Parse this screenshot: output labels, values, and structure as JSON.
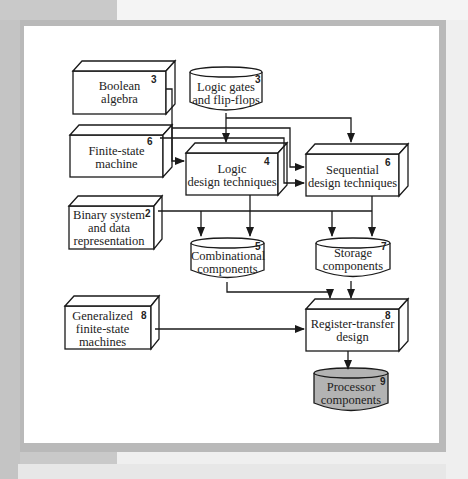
{
  "diagram": {
    "type": "flowchart",
    "nodes": [
      {
        "id": "boolean",
        "shape": "box3d",
        "label_line1": "Boolean",
        "label_line2": "algebra",
        "label_line3": "",
        "chapter": "3"
      },
      {
        "id": "gates",
        "shape": "cylinder",
        "label_line1": "Logic gates",
        "label_line2": "and flip-flops",
        "label_line3": "",
        "chapter": "3"
      },
      {
        "id": "fsm",
        "shape": "box3d",
        "label_line1": "Finite-state",
        "label_line2": "machine",
        "label_line3": "",
        "chapter": "6"
      },
      {
        "id": "logic",
        "shape": "box3d",
        "label_line1": "Logic",
        "label_line2": "design techniques",
        "label_line3": "",
        "chapter": "4"
      },
      {
        "id": "seq",
        "shape": "box3d",
        "label_line1": "Sequential",
        "label_line2": "design techniques",
        "label_line3": "",
        "chapter": "6"
      },
      {
        "id": "binary",
        "shape": "box3d",
        "label_line1": "Binary system",
        "label_line2": "and data",
        "label_line3": "representation",
        "chapter": "2"
      },
      {
        "id": "comb",
        "shape": "cylinder",
        "label_line1": "Combinational",
        "label_line2": "components",
        "label_line3": "",
        "chapter": "5"
      },
      {
        "id": "storage",
        "shape": "cylinder",
        "label_line1": "Storage",
        "label_line2": "components",
        "label_line3": "",
        "chapter": "7"
      },
      {
        "id": "gfsm",
        "shape": "box3d",
        "label_line1": "Generalized",
        "label_line2": "finite-state",
        "label_line3": "machines",
        "chapter": "8"
      },
      {
        "id": "rtl",
        "shape": "box3d",
        "label_line1": "Register-transfer",
        "label_line2": "design",
        "label_line3": "",
        "chapter": "8"
      },
      {
        "id": "proc",
        "shape": "cylinder",
        "label_line1": "Processor",
        "label_line2": "components",
        "label_line3": "",
        "chapter": "9",
        "fill": "#b3b3b3"
      }
    ],
    "edges": [
      {
        "from": "boolean",
        "to": "logic"
      },
      {
        "from": "boolean",
        "to": "seq"
      },
      {
        "from": "gates",
        "to": "logic"
      },
      {
        "from": "gates",
        "to": "seq"
      },
      {
        "from": "fsm",
        "to": "seq"
      },
      {
        "from": "logic",
        "to": "comb"
      },
      {
        "from": "seq",
        "to": "storage"
      },
      {
        "from": "binary",
        "to": "comb"
      },
      {
        "from": "binary",
        "to": "storage"
      },
      {
        "from": "comb",
        "to": "rtl"
      },
      {
        "from": "storage",
        "to": "rtl"
      },
      {
        "from": "gfsm",
        "to": "rtl"
      },
      {
        "from": "rtl",
        "to": "proc"
      }
    ],
    "colors": {
      "line": "#1a1a1a",
      "highlight_fill": "#b3b3b3",
      "frame": "#b9b9b9"
    }
  }
}
